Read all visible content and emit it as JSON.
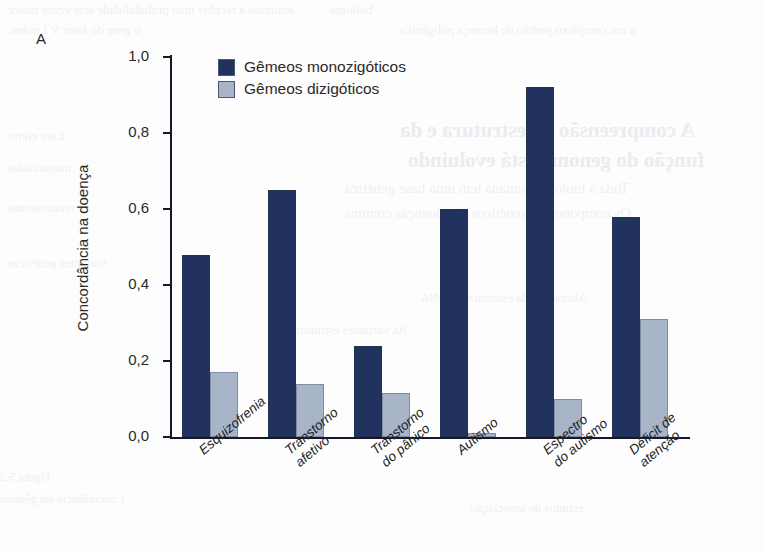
{
  "figure": {
    "panel_label": "A",
    "y_axis_title": "Concordância na doença",
    "y_ticks": [
      "0,0",
      "0,2",
      "0,4",
      "0,6",
      "0,8",
      "1,0"
    ],
    "legend": [
      {
        "label": "Gêmeos monozigóticos",
        "color": "#22325e"
      },
      {
        "label": "Gêmeos dizigóticos",
        "color": "#a8b4c8"
      }
    ]
  },
  "chart_data": {
    "type": "bar",
    "title": "",
    "xlabel": "",
    "ylabel": "Concordância na doença",
    "ylim": [
      0,
      1.0
    ],
    "yticks": [
      0.0,
      0.2,
      0.4,
      0.6,
      0.8,
      1.0
    ],
    "ytick_labels": [
      "0,0",
      "0,2",
      "0,4",
      "0,6",
      "0,8",
      "1,0"
    ],
    "grid": false,
    "legend_position": "upper-left-inside",
    "categories": [
      "Esquizofrenia",
      "Transtorno afetivo",
      "Transtorno do pânico",
      "Autismo",
      "Espectro do autismo",
      "Déficit de atenção"
    ],
    "category_lines": [
      [
        "Esquizofrenia"
      ],
      [
        "Transtorno",
        "afetivo"
      ],
      [
        "Transtorno",
        "do pânico"
      ],
      [
        "Autismo"
      ],
      [
        "Espectro",
        "do autismo"
      ],
      [
        "Déficit de",
        "atenção"
      ]
    ],
    "series": [
      {
        "name": "Gêmeos monozigóticos",
        "color": "#22325e",
        "values": [
          0.48,
          0.65,
          0.24,
          0.6,
          0.92,
          0.58
        ]
      },
      {
        "name": "Gêmeos dizigóticos",
        "color": "#a8b4c8",
        "values": [
          0.17,
          0.14,
          0.115,
          0.01,
          0.1,
          0.31
        ]
      }
    ]
  },
  "bleed_text": {
    "l1": "antinuou a receber uma probabilidade sete vezes maior",
    "l2": "o gene do fator V Leiden.",
    "l3": "a um complexo padrão de herança poligênica",
    "l4": "biologia",
    "l5": "A compreensão da estrutura e da",
    "l6": "função do genoma está evoluindo",
    "l7": "Toda a biologia humana tem uma base genética",
    "l8": "Os componentes genéticos das doenças comuns",
    "l9": "Esse efeito",
    "l10": "transmitidas",
    "l11": "cromossomo",
    "l12": "Alterações da estrutura do DNA",
    "l13": "variantes genéticas",
    "l14": "estudos de associação",
    "l15": "As variantes estruturais",
    "l16": "Figura 5-2",
    "l17": "Concordância em gêmeos"
  }
}
